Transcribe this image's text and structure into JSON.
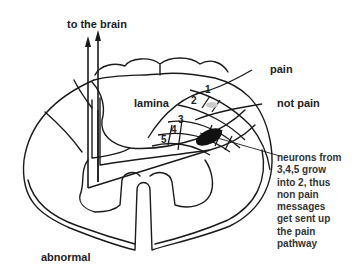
{
  "diagram": {
    "labels": {
      "to_brain": "to the brain",
      "lamina": "lamina",
      "pain": "pain",
      "not_pain": "not pain",
      "state": "abnormal"
    },
    "lamina_numbers": [
      "1",
      "2",
      "3",
      "4",
      "5"
    ],
    "annotation": "neurons from 3,4,5 grow into 2, thus non pain messages get sent up the pain pathway",
    "annotation_lines": [
      "neurons from",
      "3,4,5 grow",
      "into 2, thus",
      "non pain",
      "messages",
      "get sent up",
      "the pain",
      "pathway"
    ],
    "colors": {
      "stroke": "#1a1a1a",
      "text": "#222222",
      "grey_blob": "#cccccc",
      "black_blob": "#111111"
    }
  }
}
